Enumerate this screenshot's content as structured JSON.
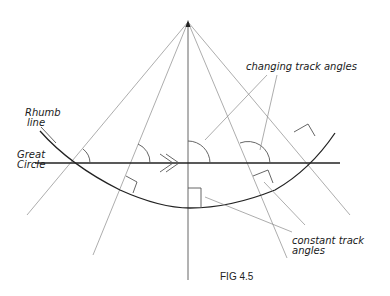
{
  "figure": {
    "caption": "FIG 4.5",
    "labels": {
      "rhumb_line": [
        "Rhumb",
        "line"
      ],
      "great_circle": [
        "Great",
        "Circle"
      ],
      "changing_track_angles": "changing track angles",
      "constant_track_angles": [
        "constant track",
        "angles"
      ]
    },
    "elements": {
      "pole_apex": {
        "x": 188,
        "y": 22
      },
      "great_circle_line": "horizontal straight line",
      "rhumb_line_curve": "arc curving below the great circle",
      "meridians": 5,
      "direction_arrow": "double chevron pointing right"
    },
    "colors": {
      "ink": "#222222",
      "construction": "#8a8a8a"
    }
  }
}
